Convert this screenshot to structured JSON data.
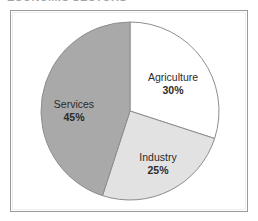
{
  "page": {
    "width": 258,
    "height": 221,
    "background": "#ffffff",
    "title_remnant": "ECONOMIC SECTORS"
  },
  "frame": {
    "border_color": "#9a9a9a",
    "fill": "#ffffff"
  },
  "chart_data": {
    "type": "pie",
    "title": "",
    "categories": [
      "Agriculture",
      "Industry",
      "Services"
    ],
    "values": [
      30,
      25,
      45
    ],
    "value_labels": [
      "30%",
      "25%",
      "45%"
    ],
    "units": "percent",
    "total": 100,
    "start_angle_deg": 0,
    "direction": "clockwise",
    "legend": "none",
    "grid": false,
    "slices": [
      {
        "label": "Agriculture",
        "value": 30,
        "value_label": "30%",
        "color": "#ffffff",
        "edge_color": "#8d8d8d",
        "start_deg": 0,
        "end_deg": 108
      },
      {
        "label": "Industry",
        "value": 25,
        "value_label": "25%",
        "color": "#e2e2e2",
        "edge_color": "#8d8d8d",
        "start_deg": 108,
        "end_deg": 198
      },
      {
        "label": "Services",
        "value": 45,
        "value_label": "45%",
        "color": "#a9a9a9",
        "edge_color": "#8d8d8d",
        "start_deg": 198,
        "end_deg": 360
      }
    ]
  },
  "geometry": {
    "center_x": 130,
    "center_y": 111,
    "radius": 89
  }
}
